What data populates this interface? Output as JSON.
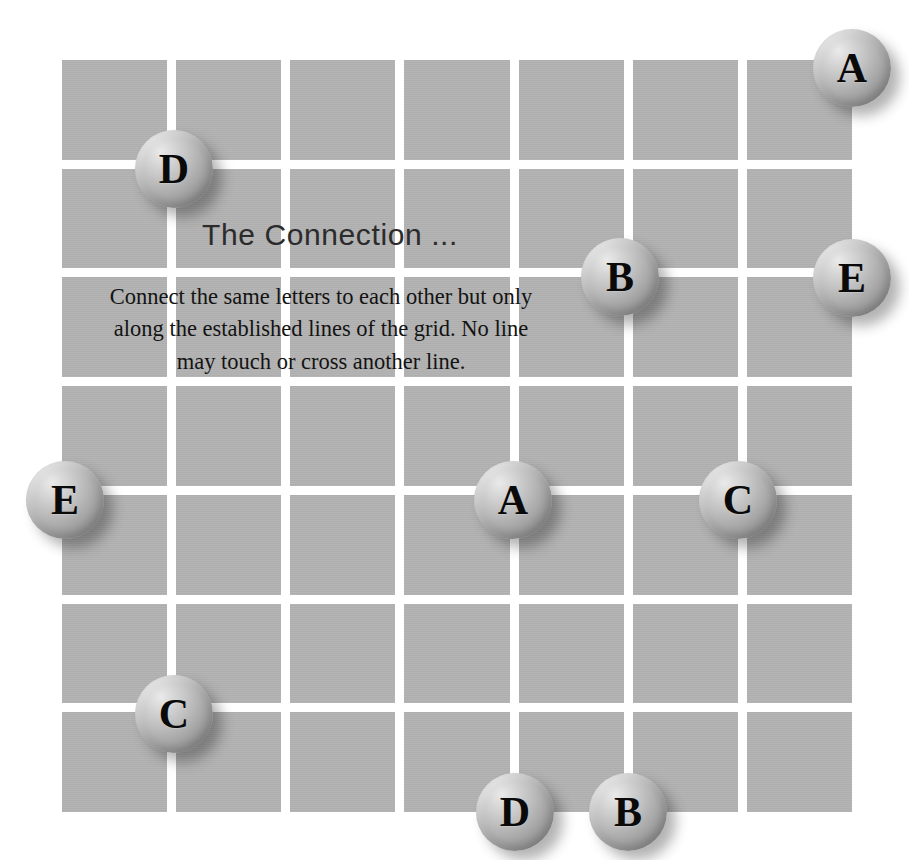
{
  "puzzle": {
    "title": "The Connection ...",
    "instructions": "Connect the same letters to each other but only along the established lines of the grid. No line may touch or cross another line.",
    "grid": {
      "columns": 7,
      "rows": 7,
      "cell_color": "#b1b1b1",
      "line_color": "#ffffff",
      "background_color": "#ffffff"
    },
    "tokens": [
      {
        "letter": "A",
        "x": 852,
        "y": 68
      },
      {
        "letter": "D",
        "x": 174,
        "y": 169
      },
      {
        "letter": "B",
        "x": 620,
        "y": 277
      },
      {
        "letter": "E",
        "x": 852,
        "y": 278
      },
      {
        "letter": "E",
        "x": 65,
        "y": 500
      },
      {
        "letter": "A",
        "x": 513,
        "y": 500
      },
      {
        "letter": "C",
        "x": 738,
        "y": 500
      },
      {
        "letter": "C",
        "x": 174,
        "y": 714
      },
      {
        "letter": "D",
        "x": 515,
        "y": 812
      },
      {
        "letter": "B",
        "x": 628,
        "y": 812
      }
    ]
  }
}
